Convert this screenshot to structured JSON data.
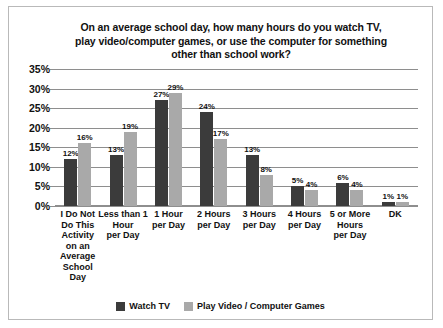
{
  "chart_data": {
    "type": "bar",
    "title": "On an average school day, how many hours do you watch TV, play video/computer games, or use the computer for something other than school work?",
    "title_lines": [
      "On an average school day, how many hours do you watch TV,",
      "play video/computer games, or use the computer for something",
      "other than school work?"
    ],
    "xlabel": "",
    "ylabel": "",
    "ylim": [
      0,
      35
    ],
    "ytick_labels": [
      "0%",
      "5%",
      "10%",
      "15%",
      "20%",
      "25%",
      "30%",
      "35%"
    ],
    "ytick_values": [
      0,
      5,
      10,
      15,
      20,
      25,
      30,
      35
    ],
    "grid": true,
    "legend_position": "bottom",
    "categories": [
      "I Do Not Do This Activity on an Average School Day",
      "Less than 1 Hour per Day",
      "1 Hour per Day",
      "2 Hours per Day",
      "3 Hours per Day",
      "4 Hours per Day",
      "5 or More Hours per Day",
      "DK"
    ],
    "category_lines": [
      [
        "I Do Not",
        "Do This",
        "Activity",
        "on an",
        "Average",
        "School",
        "Day"
      ],
      [
        "Less than 1",
        "Hour",
        "per Day"
      ],
      [
        "1 Hour",
        "per Day"
      ],
      [
        "2 Hours",
        "per Day"
      ],
      [
        "3 Hours",
        "per Day"
      ],
      [
        "4 Hours",
        "per Day"
      ],
      [
        "5 or More",
        "Hours",
        "per Day"
      ],
      [
        "DK"
      ]
    ],
    "series": [
      {
        "name": "Watch TV",
        "color": "#3b3b3b",
        "values": [
          12,
          13,
          27,
          24,
          13,
          5,
          6,
          1
        ],
        "labels": [
          "12%",
          "13%",
          "27%",
          "24%",
          "13%",
          "5%",
          "6%",
          "1%"
        ]
      },
      {
        "name": "Play Video / Computer Games",
        "color": "#a9a9a9",
        "values": [
          16,
          19,
          29,
          17,
          8,
          4,
          4,
          1
        ],
        "labels": [
          "16%",
          "19%",
          "29%",
          "17%",
          "8%",
          "4%",
          "4%",
          "1%"
        ]
      }
    ]
  },
  "colors": {
    "series_watch_tv": "#3b3b3b",
    "series_video_games": "#a9a9a9",
    "gridline": "#8e8e8e",
    "frame": "#b9b9b9",
    "text": "#111111",
    "background": "#ffffff"
  }
}
